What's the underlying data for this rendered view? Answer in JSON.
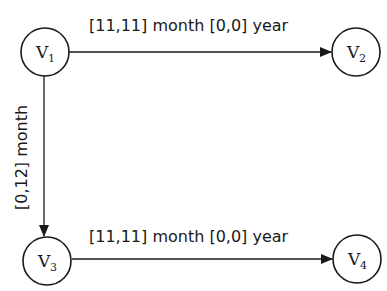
{
  "diagram": {
    "type": "directed-graph",
    "nodes": [
      {
        "id": "V1",
        "letter": "V",
        "subscript": "1",
        "cx": 45,
        "cy": 52,
        "r": 24
      },
      {
        "id": "V2",
        "letter": "V",
        "subscript": "2",
        "cx": 356,
        "cy": 52,
        "r": 24
      },
      {
        "id": "V3",
        "letter": "V",
        "subscript": "3",
        "cx": 47,
        "cy": 261,
        "r": 24
      },
      {
        "id": "V4",
        "letter": "V",
        "subscript": "4",
        "cx": 357,
        "cy": 259,
        "r": 24
      }
    ],
    "edges": [
      {
        "from": "V1",
        "to": "V2",
        "label": "[11,11] month [0,0] year",
        "orientation": "horizontal"
      },
      {
        "from": "V1",
        "to": "V3",
        "label": "[0,12] month",
        "orientation": "vertical"
      },
      {
        "from": "V3",
        "to": "V4",
        "label": "[11,11] month [0,0] year",
        "orientation": "horizontal"
      }
    ],
    "colors": {
      "stroke": "#1a1a1a",
      "background": "#ffffff"
    }
  }
}
